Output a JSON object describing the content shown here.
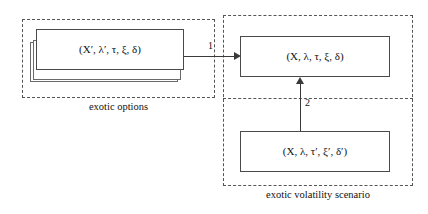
{
  "diagram": {
    "type": "flow-diagram",
    "regions": [
      {
        "id": "exotic-options",
        "caption": "exotic options"
      },
      {
        "id": "exotic-volatility-scenario",
        "caption": "exotic volatility scenario"
      }
    ],
    "boxes": [
      {
        "id": "exotic-options-params",
        "expression": "(X′, λ′, τ, ξ, δ)",
        "stacked": true,
        "stack_count": 3
      },
      {
        "id": "target-scenario",
        "expression": "(X, λ, τ, ξ, δ)",
        "stacked": false,
        "stack_count": 1
      },
      {
        "id": "source-scenario",
        "expression": "(X, λ, τ′, ξ′, δ′)",
        "stacked": false,
        "stack_count": 1
      }
    ],
    "edges": [
      {
        "id": "edge-1",
        "label": "1",
        "from": "exotic-options-params",
        "to": "target-scenario",
        "direction": "right"
      },
      {
        "id": "edge-2",
        "label": "2",
        "from": "source-scenario",
        "to": "target-scenario",
        "direction": "up"
      }
    ],
    "colors": {
      "box_stroke": "#4a4a4a",
      "region_stroke": "#555555",
      "connector": "#3a3a3a",
      "text": "#111111",
      "background": "#ffffff"
    }
  }
}
